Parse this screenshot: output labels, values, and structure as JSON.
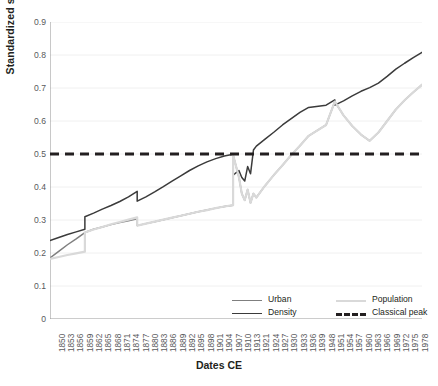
{
  "chart_data": {
    "type": "line",
    "title": "",
    "xlabel": "Dates CE",
    "ylabel": "Standardized scale",
    "ylim": [
      0,
      0.9
    ],
    "yticks": [
      "0",
      "0.1",
      "0.2",
      "0.3",
      "0.4",
      "0.5",
      "0.6",
      "0.7",
      "0.8",
      "0.9"
    ],
    "grid": true,
    "legend_position": "bottom-right",
    "xlim": [
      1850,
      1978
    ],
    "xtick_labels": [
      "1850",
      "1853",
      "1856",
      "1859",
      "1862",
      "1865",
      "1868",
      "1871",
      "1874",
      "1877",
      "1880",
      "1883",
      "1886",
      "1889",
      "1892",
      "1895",
      "1898",
      "1901",
      "1904",
      "1907",
      "1910",
      "1913",
      "1921",
      "1924",
      "1927",
      "1930",
      "1933",
      "1936",
      "1939",
      "1948",
      "1951",
      "1954",
      "1957",
      "1960",
      "1963",
      "1966",
      "1969",
      "1972",
      "1975",
      "1978"
    ],
    "series": [
      {
        "name": "Urban",
        "color": "#7f7f7f",
        "style": "solid",
        "x": [
          1850,
          1853,
          1856,
          1859,
          1862,
          1862,
          1865,
          1868,
          1871,
          1874,
          1877,
          1880,
          1880,
          1883,
          1886,
          1889,
          1892,
          1895,
          1898,
          1901,
          1904,
          1907,
          1910,
          1913,
          1913,
          1915,
          1916,
          1917,
          1918,
          1919,
          1920,
          1921,
          1924,
          1927,
          1930,
          1933,
          1936,
          1939,
          1945,
          1948,
          1948,
          1951,
          1954,
          1957,
          1960,
          1963,
          1966,
          1969,
          1972,
          1975,
          1978
        ],
        "y": [
          0.185,
          0.205,
          0.225,
          0.243,
          0.262,
          0.262,
          0.272,
          0.279,
          0.286,
          0.292,
          0.298,
          0.304,
          0.283,
          0.289,
          0.295,
          0.301,
          0.307,
          0.313,
          0.319,
          0.325,
          0.33,
          0.336,
          0.341,
          0.345,
          0.497,
          0.43,
          0.38,
          0.36,
          0.392,
          0.352,
          0.38,
          0.368,
          0.404,
          0.436,
          0.466,
          0.497,
          0.525,
          0.555,
          0.588,
          0.659,
          0.659,
          0.617,
          0.585,
          0.559,
          0.54,
          0.565,
          0.6,
          0.635,
          0.663,
          0.687,
          0.71
        ]
      },
      {
        "name": "Density",
        "color": "#3b3b3b",
        "style": "solid",
        "x": [
          1850,
          1853,
          1856,
          1859,
          1862,
          1862,
          1865,
          1868,
          1871,
          1874,
          1877,
          1880,
          1880,
          1883,
          1886,
          1889,
          1892,
          1895,
          1898,
          1901,
          1904,
          1907,
          1910,
          1913,
          1913,
          1915,
          1916,
          1917,
          1918,
          1919,
          1920,
          1921,
          1924,
          1927,
          1930,
          1933,
          1936,
          1939,
          1945,
          1948,
          1948,
          1951,
          1954,
          1957,
          1960,
          1963,
          1966,
          1969,
          1972,
          1975,
          1978
        ],
        "y": [
          0.238,
          0.247,
          0.256,
          0.264,
          0.272,
          0.31,
          0.321,
          0.333,
          0.344,
          0.356,
          0.37,
          0.387,
          0.357,
          0.37,
          0.385,
          0.401,
          0.418,
          0.434,
          0.45,
          0.464,
          0.476,
          0.486,
          0.494,
          0.499,
          0.436,
          0.45,
          0.429,
          0.418,
          0.462,
          0.44,
          0.512,
          0.524,
          0.545,
          0.566,
          0.588,
          0.607,
          0.626,
          0.641,
          0.648,
          0.664,
          0.648,
          0.661,
          0.676,
          0.69,
          0.701,
          0.715,
          0.735,
          0.757,
          0.775,
          0.792,
          0.808
        ]
      },
      {
        "name": "Population",
        "color": "#d9d9d9",
        "style": "solid",
        "x": [
          1850,
          1853,
          1856,
          1859,
          1862,
          1862,
          1865,
          1868,
          1871,
          1874,
          1877,
          1880,
          1880,
          1883,
          1886,
          1889,
          1892,
          1895,
          1898,
          1901,
          1904,
          1907,
          1910,
          1913,
          1913,
          1915,
          1916,
          1917,
          1918,
          1919,
          1920,
          1921,
          1924,
          1927,
          1930,
          1933,
          1936,
          1939,
          1945,
          1948,
          1951,
          1954,
          1957,
          1960,
          1963,
          1966,
          1969,
          1972,
          1975,
          1978
        ],
        "y": [
          0.182,
          0.188,
          0.194,
          0.199,
          0.204,
          0.262,
          0.271,
          0.279,
          0.287,
          0.294,
          0.301,
          0.308,
          0.283,
          0.289,
          0.295,
          0.301,
          0.307,
          0.313,
          0.319,
          0.325,
          0.33,
          0.336,
          0.341,
          0.345,
          0.497,
          0.43,
          0.38,
          0.36,
          0.392,
          0.352,
          0.38,
          0.368,
          0.404,
          0.436,
          0.466,
          0.497,
          0.525,
          0.555,
          0.588,
          0.659,
          0.617,
          0.585,
          0.559,
          0.54,
          0.565,
          0.6,
          0.635,
          0.663,
          0.687,
          0.71
        ]
      },
      {
        "name": "Classical peak",
        "color": "#231f20",
        "style": "dashed",
        "constant_y": 0.5
      }
    ]
  },
  "legend": {
    "items": [
      {
        "label": "Urban",
        "color": "#7f7f7f",
        "style": "solid"
      },
      {
        "label": "Population",
        "color": "#d9d9d9",
        "style": "solid"
      },
      {
        "label": "Density",
        "color": "#3b3b3b",
        "style": "solid"
      },
      {
        "label": "Classical peak",
        "color": "#231f20",
        "style": "dashed"
      }
    ]
  }
}
